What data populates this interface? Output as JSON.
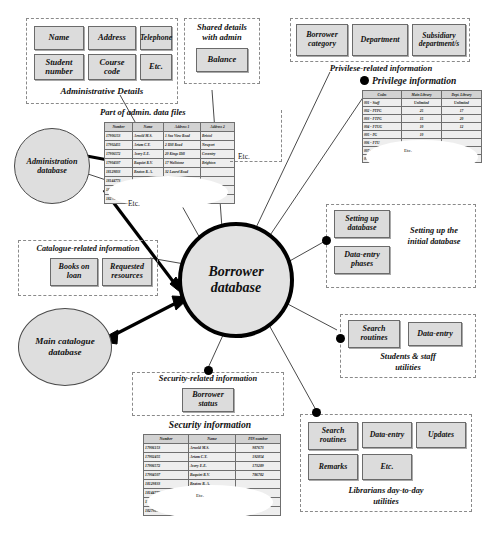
{
  "diagram": {
    "center": {
      "label": "Borrower\ndatabase",
      "line1": "Borrower",
      "line2": "database"
    },
    "nodes": {
      "administration_db": {
        "line1": "Administration",
        "line2": "database"
      },
      "main_catalogue_db": {
        "line1": "Main catalogue",
        "line2": "database"
      }
    },
    "groups": {
      "administrative_details": {
        "caption": "Administrative Details",
        "boxes": [
          "Name",
          "Address",
          "Telephone",
          "Student\nnumber",
          "Course\ncode",
          "Etc."
        ],
        "box_labels": [
          {
            "l1": "Name",
            "l2": ""
          },
          {
            "l1": "Address",
            "l2": ""
          },
          {
            "l1": "Telephone",
            "l2": ""
          },
          {
            "l1": "Student",
            "l2": "number"
          },
          {
            "l1": "Course",
            "l2": "code"
          },
          {
            "l1": "Etc.",
            "l2": ""
          }
        ]
      },
      "shared_details": {
        "caption_l1": "Shared details",
        "caption_l2": "with admin",
        "box_labels": [
          {
            "l1": "Balance",
            "l2": ""
          }
        ]
      },
      "privilege_related": {
        "caption": "Privilese-related information",
        "box_labels": [
          {
            "l1": "Borrower",
            "l2": "category"
          },
          {
            "l1": "Department",
            "l2": ""
          },
          {
            "l1": "Subsidiary",
            "l2": "department/s"
          }
        ]
      },
      "setting_up": {
        "caption_l1": "Setting up the",
        "caption_l2": "initial database",
        "box_labels": [
          {
            "l1": "Setting up",
            "l2": "database"
          },
          {
            "l1": "Data-entry",
            "l2": "phases"
          }
        ]
      },
      "students_staff": {
        "caption_l1": "Students & staff",
        "caption_l2": "utilities",
        "box_labels": [
          {
            "l1": "Search",
            "l2": "routines"
          },
          {
            "l1": "Data-entry",
            "l2": ""
          }
        ]
      },
      "librarians": {
        "caption_l1": "Librarians day-to-day",
        "caption_l2": "utilities",
        "box_labels": [
          {
            "l1": "Search",
            "l2": "routines"
          },
          {
            "l1": "Data-entry",
            "l2": ""
          },
          {
            "l1": "Updates",
            "l2": ""
          },
          {
            "l1": "Remarks",
            "l2": ""
          },
          {
            "l1": "Etc.",
            "l2": ""
          }
        ]
      },
      "catalogue_related": {
        "caption": "Catalogue-related information",
        "box_labels": [
          {
            "l1": "Books on",
            "l2": "loan"
          },
          {
            "l1": "Requested",
            "l2": "resources"
          }
        ]
      },
      "security_related": {
        "caption": "Security-related information",
        "box_labels": [
          {
            "l1": "Borrower",
            "l2": "status"
          }
        ]
      }
    },
    "tables": {
      "admin_data_files": {
        "caption": "Part of admin. data files",
        "headers": [
          "Number",
          "Name",
          "Address 1",
          "Address 2"
        ],
        "rows": [
          [
            "17906153",
            "Arnold M.S.",
            "1 Sea View Road",
            "Bristol"
          ],
          [
            "17902455",
            "Artam C.Y.",
            "2 Hill Road",
            "Newport"
          ],
          [
            "17906572",
            "Avery E.E.",
            "20 Kings Hill",
            "Coventry"
          ],
          [
            "17904507",
            "Baquiet R.V.",
            "17 Wallstone",
            "Brighton"
          ],
          [
            "18129833",
            "Beaton R. A.",
            "32 Laurel Road",
            ""
          ],
          [
            "18144773",
            "Berger W.",
            "",
            ""
          ],
          [
            "18225476",
            "Brown S.T.",
            "",
            ""
          ],
          [
            "18279856",
            "Bromans A.J.",
            "",
            ""
          ]
        ],
        "etc_label": "Etc.",
        "side_etc_label": "Etc."
      },
      "privilege_information": {
        "caption": "Privilege information",
        "headers": [
          "Codes",
          "Main Library",
          "Dept. Library"
        ],
        "rows": [
          [
            "001 - Staff",
            "Unlimited",
            "Unlimited"
          ],
          [
            "002 - PTPG",
            "25",
            "17"
          ],
          [
            "003 - FTPG",
            "15",
            "20"
          ],
          [
            "004 - FTUG",
            "10",
            "12"
          ],
          [
            "005 - PG",
            "10",
            ""
          ],
          [
            "006 - FTU",
            "",
            ""
          ],
          [
            "007 - PTU",
            "",
            ""
          ],
          [
            "008 - PTU",
            "",
            ""
          ]
        ],
        "etc_label": "Etc."
      },
      "security_information": {
        "caption": "Security information",
        "headers": [
          "Number",
          "Name",
          "PIN number"
        ],
        "rows": [
          [
            "17906153",
            "Arnold M.S.",
            "987673"
          ],
          [
            "17902455",
            "Artam C.Y.",
            "192854"
          ],
          [
            "17906572",
            "Avery E.E.",
            "173289"
          ],
          [
            "17904507",
            "Baquiet R.V.",
            "786782"
          ],
          [
            "18129833",
            "Beaton R. A.",
            ""
          ],
          [
            "18144773",
            "",
            ""
          ],
          [
            "18225476",
            "",
            ""
          ],
          [
            "18279856",
            "",
            ""
          ]
        ],
        "etc_label": "Etc."
      }
    }
  }
}
